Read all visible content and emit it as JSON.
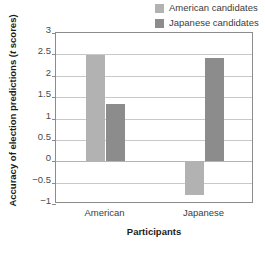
{
  "chart_data": {
    "type": "bar",
    "title": "",
    "xlabel": "Participants",
    "ylabel": "Accuracy of election predictions (t scores)",
    "ylabel_prefix": "Accuracy of election predictions (",
    "ylabel_italic": "t",
    "ylabel_suffix": " scores)",
    "categories": [
      "American",
      "Japanese"
    ],
    "series": [
      {
        "name": "American candidates",
        "color": "#b2b2b2",
        "values": [
          2.48,
          -0.78
        ]
      },
      {
        "name": "Japanese candidates",
        "color": "#8c8c8c",
        "values": [
          1.35,
          2.42
        ]
      }
    ],
    "ylim": [
      -1,
      3
    ],
    "yticks": [
      3,
      2.5,
      2,
      1.5,
      1,
      0.5,
      0,
      -0.5,
      -1
    ],
    "ytick_labels": [
      "3",
      "2.5",
      "2",
      "1.5",
      "1",
      "0.5",
      "0",
      "−0.5",
      "−1"
    ],
    "grid": true,
    "legend_position": "top-right",
    "zero_baseline": 0
  },
  "legend": {
    "items": [
      {
        "label": "American candidates",
        "color": "#b2b2b2"
      },
      {
        "label": "Japanese candidates",
        "color": "#8c8c8c"
      }
    ]
  }
}
